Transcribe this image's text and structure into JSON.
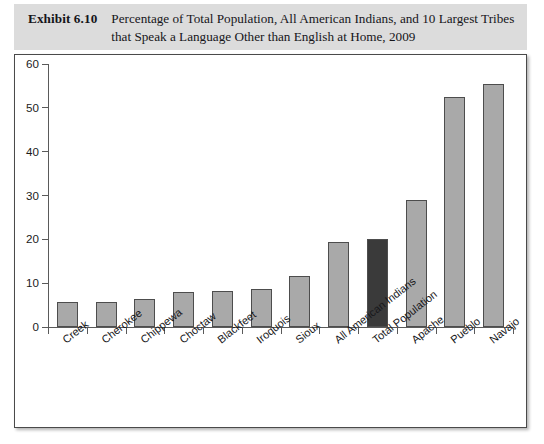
{
  "header": {
    "exhibit_label": "Exhibit 6.10",
    "title": "Percentage of Total Population, All American Indians, and 10 Largest Tribes that Speak a Language Other than English at Home, 2009"
  },
  "colors": {
    "bar_fill": "#a9a9a9",
    "bar_highlight_fill": "#3a3a3a",
    "bar_border": "#4d4d4d",
    "axis": "#5a5a5a",
    "header_band": "#dcdcdc",
    "frame": "#4a4a4a",
    "text": "#17171a"
  },
  "chart_data": {
    "type": "bar",
    "title": "Percentage of Total Population, All American Indians, and 10 Largest Tribes that Speak a Language Other than English at Home, 2009",
    "xlabel": "",
    "ylabel": "",
    "ylim": [
      0,
      60
    ],
    "yticks": [
      0,
      10,
      20,
      30,
      40,
      50,
      60
    ],
    "grid": false,
    "legend": "none",
    "categories": [
      "Creek",
      "Cherokee",
      "Chippewa",
      "Choctaw",
      "Blackfeet",
      "Iroquois",
      "Sioux",
      "All American Indians",
      "Total Population",
      "Apache",
      "Pueblo",
      "Navajo"
    ],
    "values": [
      5.6,
      5.7,
      6.5,
      7.9,
      8.2,
      8.6,
      11.7,
      19.5,
      20.1,
      29.0,
      52.4,
      55.5
    ],
    "highlighted": [
      "Total Population"
    ]
  }
}
